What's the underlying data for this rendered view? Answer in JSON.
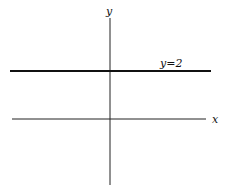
{
  "diagram": {
    "type": "coordinate-plane",
    "axes": {
      "x_label": "x",
      "y_label": "y"
    },
    "lines": [
      {
        "equation": "y=2",
        "label": "y=2",
        "orientation": "horizontal",
        "value": 2
      }
    ],
    "colors": {
      "axis": "#222222",
      "line": "#111111",
      "background": "#ffffff"
    }
  }
}
